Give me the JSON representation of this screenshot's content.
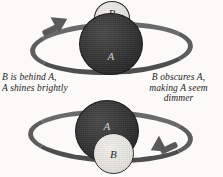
{
  "figure": {
    "background_color": "#fbfaf8",
    "ring_color": "#5a5a5a",
    "sphere_a_color": "#2c2c2c",
    "sphere_b_color": "#e6e5df"
  },
  "top_panel": {
    "sphere_a_label": "A",
    "sphere_b_label": "B",
    "orbit_icon": "orbit-ring-arrow-counterclockwise",
    "caption": {
      "lines": [
        "B is behind A,",
        "A shines brightly"
      ],
      "line1": "B is behind A,",
      "line2": "A shines brightly"
    }
  },
  "bottom_panel": {
    "sphere_a_label": "A",
    "sphere_b_label": "B",
    "orbit_icon": "orbit-ring-arrow-clockwise",
    "caption": {
      "lines": [
        "B obscures A,",
        "making A seem",
        "dimmer"
      ],
      "line1": "B obscures A,",
      "line2": "making A seem",
      "line3": "dimmer"
    }
  }
}
